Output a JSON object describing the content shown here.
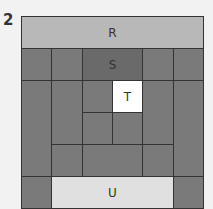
{
  "figure_number": "2",
  "colors": {
    "background": "#f2f2f2",
    "block": "#7a7a7a",
    "S": "#6a6a6a",
    "R": "#b8b8b8",
    "U": "#e0e0e0",
    "T": "#ffffff",
    "line": "#333333"
  },
  "grid": {
    "columns": 6,
    "rows": 6
  },
  "pieces": [
    {
      "id": "R",
      "label": "R",
      "col": 0,
      "row": 0,
      "w": 6,
      "h": 1,
      "color": "#b8b8b8"
    },
    {
      "id": "p1",
      "label": "",
      "col": 0,
      "row": 1,
      "w": 1,
      "h": 1,
      "color": "#7a7a7a"
    },
    {
      "id": "p2",
      "label": "",
      "col": 1,
      "row": 1,
      "w": 1,
      "h": 1,
      "color": "#7a7a7a"
    },
    {
      "id": "S",
      "label": "S",
      "col": 2,
      "row": 1,
      "w": 2,
      "h": 1,
      "color": "#6a6a6a"
    },
    {
      "id": "p3",
      "label": "",
      "col": 4,
      "row": 1,
      "w": 1,
      "h": 1,
      "color": "#7a7a7a"
    },
    {
      "id": "p4",
      "label": "",
      "col": 5,
      "row": 1,
      "w": 1,
      "h": 1,
      "color": "#7a7a7a"
    },
    {
      "id": "p5",
      "label": "",
      "col": 0,
      "row": 2,
      "w": 1,
      "h": 3,
      "color": "#7a7a7a"
    },
    {
      "id": "p6",
      "label": "",
      "col": 1,
      "row": 2,
      "w": 1,
      "h": 2,
      "color": "#7a7a7a"
    },
    {
      "id": "p7",
      "label": "",
      "col": 2,
      "row": 2,
      "w": 1,
      "h": 1,
      "color": "#7a7a7a"
    },
    {
      "id": "T",
      "label": "T",
      "col": 3,
      "row": 2,
      "w": 1,
      "h": 1,
      "color": "#ffffff"
    },
    {
      "id": "p8",
      "label": "",
      "col": 4,
      "row": 2,
      "w": 1,
      "h": 2,
      "color": "#7a7a7a"
    },
    {
      "id": "p9",
      "label": "",
      "col": 5,
      "row": 2,
      "w": 1,
      "h": 3,
      "color": "#7a7a7a"
    },
    {
      "id": "p10",
      "label": "",
      "col": 2,
      "row": 3,
      "w": 1,
      "h": 1,
      "color": "#7a7a7a"
    },
    {
      "id": "p11",
      "label": "",
      "col": 3,
      "row": 3,
      "w": 1,
      "h": 1,
      "color": "#7a7a7a"
    },
    {
      "id": "p12",
      "label": "",
      "col": 1,
      "row": 4,
      "w": 1,
      "h": 1,
      "color": "#7a7a7a"
    },
    {
      "id": "p13",
      "label": "",
      "col": 2,
      "row": 4,
      "w": 2,
      "h": 1,
      "color": "#7a7a7a"
    },
    {
      "id": "p14",
      "label": "",
      "col": 4,
      "row": 4,
      "w": 1,
      "h": 1,
      "color": "#7a7a7a"
    },
    {
      "id": "p15",
      "label": "",
      "col": 0,
      "row": 5,
      "w": 1,
      "h": 1,
      "color": "#7a7a7a"
    },
    {
      "id": "U",
      "label": "U",
      "col": 1,
      "row": 5,
      "w": 4,
      "h": 1,
      "color": "#e0e0e0"
    },
    {
      "id": "p16",
      "label": "",
      "col": 5,
      "row": 5,
      "w": 1,
      "h": 1,
      "color": "#7a7a7a"
    }
  ]
}
